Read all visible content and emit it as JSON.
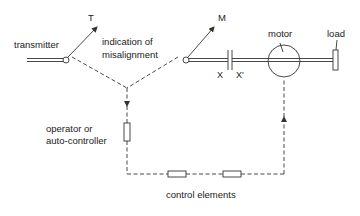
{
  "diagram": {
    "type": "control loop schematic",
    "labels": {
      "transmitter": "transmitter",
      "transmitter_pointer": "T",
      "misalignment_line1": "indication of",
      "misalignment_line2": "misalignment",
      "motor_pointer": "M",
      "motor": "motor",
      "load": "load",
      "coupling_left": "X",
      "coupling_right": "X'",
      "operator_line1": "operator or",
      "operator_line2": "auto-controller",
      "control_elements": "control elements"
    },
    "components": [
      {
        "id": "transmitter-shaft",
        "kind": "double-line shaft"
      },
      {
        "id": "transmitter-pivot",
        "kind": "pivot circle"
      },
      {
        "id": "pointer-T",
        "kind": "arrow"
      },
      {
        "id": "pointer-M",
        "kind": "arrow"
      },
      {
        "id": "motor-shaft",
        "kind": "double-line shaft"
      },
      {
        "id": "coupling-XX'",
        "kind": "capacitor-like coupling"
      },
      {
        "id": "motor",
        "kind": "circle"
      },
      {
        "id": "load",
        "kind": "rectangle"
      },
      {
        "id": "operator-element",
        "kind": "resistor box"
      },
      {
        "id": "control-element-1",
        "kind": "resistor box"
      },
      {
        "id": "control-element-2",
        "kind": "resistor box"
      }
    ],
    "colors": {
      "line": "#333333",
      "text": "#222222",
      "background": "#ffffff"
    }
  }
}
